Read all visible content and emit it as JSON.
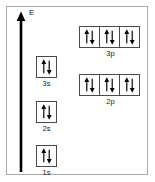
{
  "diagram": {
    "axis": {
      "label": "E",
      "name": "energy-axis",
      "direction": "up"
    },
    "colors": {
      "frame_border": "#a9a9a9",
      "box_border": "#4a4a4a",
      "arrow": "#000000",
      "text": "#1a1a1a",
      "background": "#ffffff"
    },
    "subshells": [
      {
        "label": "1s",
        "type": "s",
        "orbitals": 1,
        "boxes": [
          {
            "spins": [
              "up",
              "down"
            ]
          }
        ]
      },
      {
        "label": "2s",
        "type": "s",
        "orbitals": 1,
        "boxes": [
          {
            "spins": [
              "up",
              "down"
            ]
          }
        ]
      },
      {
        "label": "3s",
        "type": "s",
        "orbitals": 1,
        "boxes": [
          {
            "spins": [
              "up",
              "down"
            ]
          }
        ]
      },
      {
        "label": "2p",
        "type": "p",
        "orbitals": 3,
        "boxes": [
          {
            "spins": [
              "up",
              "down"
            ]
          },
          {
            "spins": [
              "up",
              "down"
            ]
          },
          {
            "spins": [
              "up",
              "down"
            ]
          }
        ]
      },
      {
        "label": "3p",
        "type": "p",
        "orbitals": 3,
        "boxes": [
          {
            "spins": [
              "up",
              "down"
            ]
          },
          {
            "spins": [
              "up",
              "down"
            ]
          },
          {
            "spins": [
              "up",
              "down"
            ]
          }
        ]
      }
    ],
    "labels": {
      "s1": "1s",
      "s2": "2s",
      "s3": "3s",
      "p2": "2p",
      "p3": "3p"
    }
  }
}
